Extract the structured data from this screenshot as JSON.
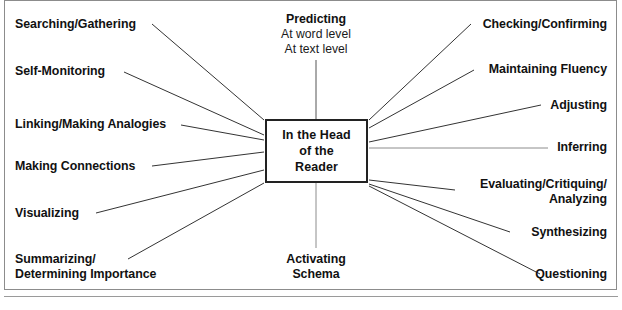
{
  "diagram": {
    "title": "In the Head of the Reader",
    "type": "radial-spoke-diagram",
    "center": {
      "lines": [
        "In the Head",
        "of the",
        "Reader"
      ]
    },
    "colors": {
      "frame_border": "#8c8c8c",
      "box_border": "#222222",
      "spoke_line": "#333333",
      "text": "#111111",
      "background": "#ffffff"
    },
    "nodes": {
      "top": {
        "heading": "Predicting",
        "sub_lines": [
          "At word level",
          "At text level"
        ]
      },
      "bottom": {
        "lines": [
          "Activating",
          "Schema"
        ]
      },
      "left": [
        {
          "id": "searching-gathering",
          "lines": [
            "Searching/Gathering"
          ]
        },
        {
          "id": "self-monitoring",
          "lines": [
            "Self-Monitoring"
          ]
        },
        {
          "id": "linking-making-analogies",
          "lines": [
            "Linking/Making Analogies"
          ]
        },
        {
          "id": "making-connections",
          "lines": [
            "Making Connections"
          ]
        },
        {
          "id": "visualizing",
          "lines": [
            "Visualizing"
          ]
        },
        {
          "id": "summarizing-determining-importance",
          "lines": [
            "Summarizing/",
            "Determining Importance"
          ]
        }
      ],
      "right": [
        {
          "id": "checking-confirming",
          "lines": [
            "Checking/Confirming"
          ]
        },
        {
          "id": "maintaining-fluency",
          "lines": [
            "Maintaining Fluency"
          ]
        },
        {
          "id": "adjusting",
          "lines": [
            "Adjusting"
          ]
        },
        {
          "id": "inferring",
          "lines": [
            "Inferring"
          ]
        },
        {
          "id": "evaluating-critiquing-analyzing",
          "lines": [
            "Evaluating/Critiquing/",
            "Analyzing"
          ]
        },
        {
          "id": "synthesizing",
          "lines": [
            "Synthesizing"
          ]
        },
        {
          "id": "questioning",
          "lines": [
            "Questioning"
          ]
        }
      ]
    }
  }
}
